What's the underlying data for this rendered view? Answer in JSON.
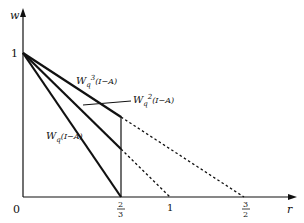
{
  "diagram": {
    "axes": {
      "y_label": "w",
      "x_label": "r",
      "origin_label": "0",
      "y_tick_label": "1"
    },
    "x_ticks": [
      {
        "num": "2",
        "den": "3",
        "value": 0.6667
      },
      {
        "label": "1",
        "value": 1
      },
      {
        "num": "3",
        "den": "2",
        "value": 1.5
      }
    ],
    "lines": [
      {
        "name": "Wq(I-A)",
        "label_main": "W",
        "label_sub": "q",
        "label_sup": "",
        "label_tail": "(I−A)",
        "from": [
          0,
          1
        ],
        "solid_to": [
          0.6667,
          0
        ],
        "dashed_to": null
      },
      {
        "name": "Wq2(I-A)",
        "label_main": "W",
        "label_sub": "q",
        "label_sup": "2",
        "label_tail": "(I−A)",
        "from": [
          0,
          1
        ],
        "solid_to": [
          0.6667,
          0.3333
        ],
        "dashed_to": [
          1,
          0
        ]
      },
      {
        "name": "Wq3(I-A)",
        "label_main": "W",
        "label_sub": "q",
        "label_sup": "3",
        "label_tail": "(I−A)",
        "from": [
          0,
          1
        ],
        "solid_to": [
          0.6667,
          0.5556
        ],
        "dashed_to": [
          1.5,
          0
        ]
      }
    ],
    "vertical_line_at": 0.6667
  }
}
